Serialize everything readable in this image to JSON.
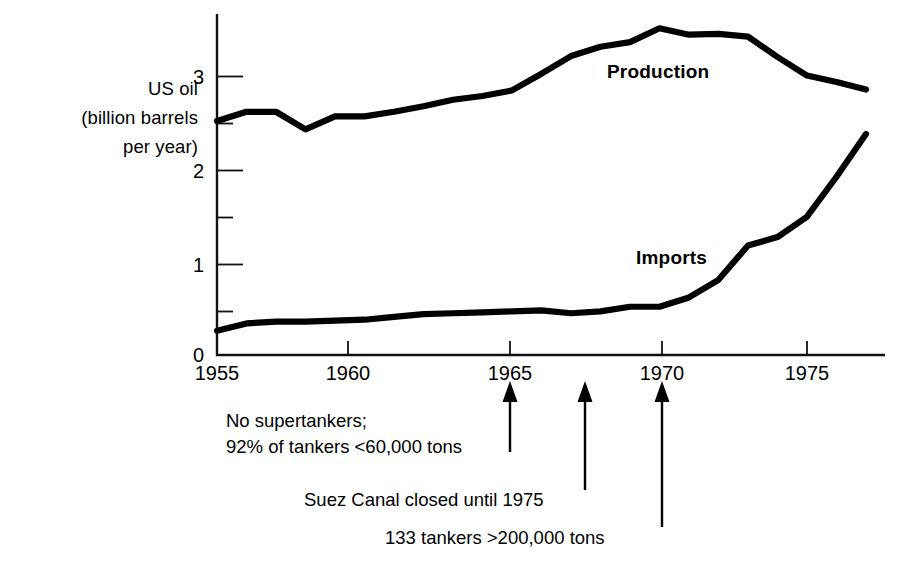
{
  "chart_data": {
    "type": "line",
    "title": "",
    "subtitle": "",
    "ylabel": "US oil\n(billion barrels\nper year)",
    "ylabel_lines": [
      "US oil",
      "(billion barrels",
      "per year)"
    ],
    "xlabel": "",
    "xlim": [
      1955,
      1977
    ],
    "ylim": [
      0,
      3.6
    ],
    "grid": false,
    "legend_position": "inline-on-curves",
    "x": [
      1955,
      1956,
      1957,
      1958,
      1959,
      1960,
      1961,
      1962,
      1963,
      1964,
      1965,
      1966,
      1967,
      1968,
      1969,
      1970,
      1971,
      1972,
      1973,
      1974,
      1975,
      1976,
      1977
    ],
    "series": [
      {
        "name": "Production",
        "color": "#000000",
        "values": [
          2.52,
          2.62,
          2.62,
          2.43,
          2.57,
          2.57,
          2.62,
          2.68,
          2.75,
          2.79,
          2.85,
          3.03,
          3.22,
          3.32,
          3.37,
          3.52,
          3.45,
          3.46,
          3.43,
          3.21,
          3.01,
          2.94,
          2.86
        ]
      },
      {
        "name": "Imports",
        "color": "#000000",
        "values": [
          0.26,
          0.34,
          0.36,
          0.36,
          0.37,
          0.38,
          0.41,
          0.44,
          0.45,
          0.46,
          0.47,
          0.48,
          0.45,
          0.47,
          0.52,
          0.52,
          0.62,
          0.81,
          1.18,
          1.27,
          1.49,
          1.92,
          2.38
        ]
      }
    ],
    "y_major_ticks": [
      0,
      1,
      2,
      3
    ],
    "y_minor_ticks": [
      0.5,
      1.5,
      2.5
    ],
    "y_tick_labels": [
      "0",
      "1",
      "2",
      "3"
    ],
    "x_major_ticks": [
      1955,
      1960,
      1965,
      1970,
      1975
    ],
    "x_tick_labels": [
      "1955",
      "1960",
      "1965",
      "1970",
      "1975"
    ],
    "annotations": [
      {
        "id": "no-supertankers",
        "lines": [
          "No supertankers;",
          "92% of tankers <60,000 tons"
        ],
        "text": "No supertankers; 92% of tankers <60,000 tons",
        "arrow_x": 1965.0
      },
      {
        "id": "suez-canal",
        "lines": [
          "Suez Canal closed until 1975"
        ],
        "text": "Suez Canal closed until 1975",
        "arrow_x": 1967.3
      },
      {
        "id": "133-tankers",
        "lines": [
          "133 tankers >200,000 tons"
        ],
        "text": "133 tankers >200,000 tons",
        "arrow_x": 1970.0
      }
    ]
  },
  "axis": {
    "y_title_line1": "US oil",
    "y_title_line2": "(billion barrels",
    "y_title_line3": "per year)",
    "y_label_0": "0",
    "y_label_1": "1",
    "y_label_2": "2",
    "y_label_3": "3",
    "x_label_1955": "1955",
    "x_label_1960": "1960",
    "x_label_1965": "1965",
    "x_label_1970": "1970",
    "x_label_1975": "1975"
  },
  "series_labels": {
    "production": "Production",
    "imports": "Imports"
  },
  "annotations": {
    "a1_line1": "No supertankers;",
    "a1_line2": "92% of tankers <60,000 tons",
    "a2_line1": "Suez Canal closed until 1975",
    "a3_line1": "133 tankers >200,000 tons"
  },
  "colors": {
    "ink": "#000000",
    "background": "#ffffff",
    "axis": "#1a1a1a"
  }
}
